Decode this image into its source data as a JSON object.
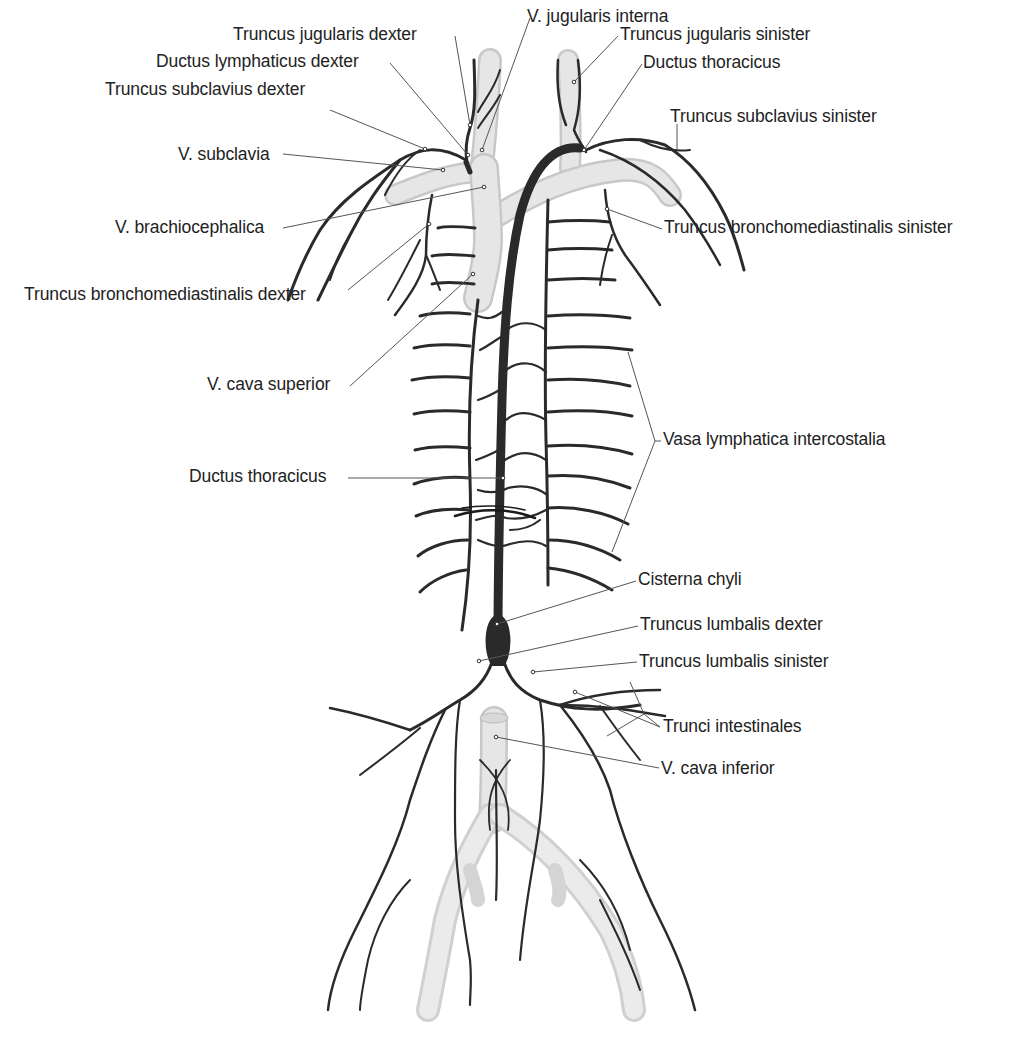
{
  "figure": {
    "colors": {
      "background": "#ffffff",
      "lymph_vessel": "#2a2a2a",
      "vein": "#dcdcdc",
      "vein_edge": "#c4c4c4",
      "leader_line": "#555555",
      "label_text": "#222222"
    },
    "labels": [
      {
        "id": "v-jugularis-interna",
        "text": "V. jugularis interna",
        "x": 527,
        "y": 6,
        "align": "left",
        "anchor": [
          482,
          150
        ]
      },
      {
        "id": "truncus-jugularis-dexter",
        "text": "Truncus jugularis dexter",
        "x": 233,
        "y": 24,
        "align": "left",
        "anchor": [
          470,
          125
        ]
      },
      {
        "id": "truncus-jugularis-sinister",
        "text": "Truncus jugularis sinister",
        "x": 620,
        "y": 24,
        "align": "left",
        "anchor": [
          574,
          82
        ]
      },
      {
        "id": "ductus-lymphaticus-dexter",
        "text": "Ductus lymphaticus dexter",
        "x": 156,
        "y": 51,
        "align": "left",
        "anchor": [
          468,
          155
        ]
      },
      {
        "id": "ductus-thoracicus-top",
        "text": "Ductus thoracicus",
        "x": 643,
        "y": 52,
        "align": "left",
        "anchor": [
          584,
          152
        ]
      },
      {
        "id": "truncus-subclavius-dexter",
        "text": "Truncus subclavius dexter",
        "x": 105,
        "y": 79,
        "align": "left",
        "anchor": [
          425,
          149
        ]
      },
      {
        "id": "truncus-subclavius-sinister",
        "text": "Truncus subclavius sinister",
        "x": 670,
        "y": 106,
        "align": "left",
        "anchor": [
          677,
          152
        ]
      },
      {
        "id": "v-subclavia",
        "text": "V. subclavia",
        "x": 178,
        "y": 144,
        "align": "left",
        "anchor": [
          443,
          170
        ]
      },
      {
        "id": "v-brachiocephalica",
        "text": "V. brachiocephalica",
        "x": 115,
        "y": 217,
        "align": "left",
        "anchor": [
          484,
          187
        ]
      },
      {
        "id": "truncus-bronchomediastinalis-sinister",
        "text": "Truncus bronchomediastinalis sinister",
        "x": 664,
        "y": 217,
        "align": "left",
        "anchor": [
          607,
          209
        ]
      },
      {
        "id": "truncus-bronchomediastinalis-dexter",
        "text": "Truncus bronchomediastinalis dexter",
        "x": 24,
        "y": 284,
        "align": "left",
        "anchor": [
          429,
          224
        ]
      },
      {
        "id": "v-cava-superior",
        "text": "V. cava superior",
        "x": 207,
        "y": 374,
        "align": "left",
        "anchor": [
          473,
          274
        ]
      },
      {
        "id": "vasa-lymphatica-intercostalia",
        "text": "Vasa lymphatica intercostalia",
        "x": 663,
        "y": 429,
        "align": "left",
        "anchor": [
          655,
          440
        ]
      },
      {
        "id": "ductus-thoracicus",
        "text": "Ductus thoracicus",
        "x": 189,
        "y": 466,
        "align": "left",
        "anchor": [
          503,
          478
        ]
      },
      {
        "id": "cisterna-chyli",
        "text": "Cisterna chyli",
        "x": 638,
        "y": 569,
        "align": "left",
        "anchor": [
          497,
          624
        ]
      },
      {
        "id": "truncus-lumbalis-dexter",
        "text": "Truncus lumbalis dexter",
        "x": 640,
        "y": 614,
        "align": "left",
        "anchor": [
          479,
          661
        ]
      },
      {
        "id": "truncus-lumbalis-sinister",
        "text": "Truncus lumbalis sinister",
        "x": 639,
        "y": 651,
        "align": "left",
        "anchor": [
          533,
          672
        ]
      },
      {
        "id": "trunci-intestinales",
        "text": "Trunci intestinales",
        "x": 663,
        "y": 716,
        "align": "left",
        "anchor": [
          644,
          714
        ]
      },
      {
        "id": "v-cava-inferior",
        "text": "V. cava inferior",
        "x": 661,
        "y": 758,
        "align": "left",
        "anchor": [
          496,
          737
        ]
      }
    ]
  }
}
